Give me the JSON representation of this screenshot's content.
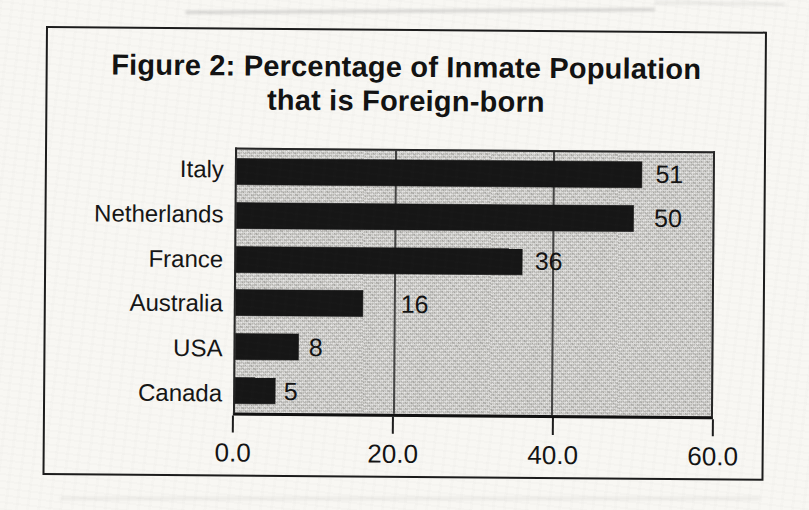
{
  "figure": {
    "title_line1": "Figure 2: Percentage of Inmate Population",
    "title_line2": "that is Foreign-born"
  },
  "chart_data": {
    "type": "bar",
    "orientation": "horizontal",
    "title": "Figure 2: Percentage of Inmate Population that is Foreign-born",
    "categories": [
      "Italy",
      "Netherlands",
      "France",
      "Australia",
      "USA",
      "Canada"
    ],
    "values": [
      51,
      50,
      36,
      16,
      8,
      5
    ],
    "data_labels": [
      "51",
      "50",
      "36",
      "16",
      "8",
      "5"
    ],
    "xlabel": "",
    "ylabel": "",
    "xlim": [
      0,
      60
    ],
    "xticks": [
      0,
      20,
      40,
      60
    ],
    "xtick_labels": [
      "0.0",
      "20.0",
      "40.0",
      "60.0"
    ],
    "gridlines_x": [
      20,
      40
    ],
    "legend": "none",
    "value_label_offsets_px": [
      14,
      21,
      13,
      38,
      10,
      9
    ],
    "bar_color": "#161616",
    "plot_bg_color": "#cac9c5"
  },
  "colors": {
    "page_bg": "#f8f7f3",
    "frame_border": "#1b1b1b",
    "text": "#131313"
  }
}
